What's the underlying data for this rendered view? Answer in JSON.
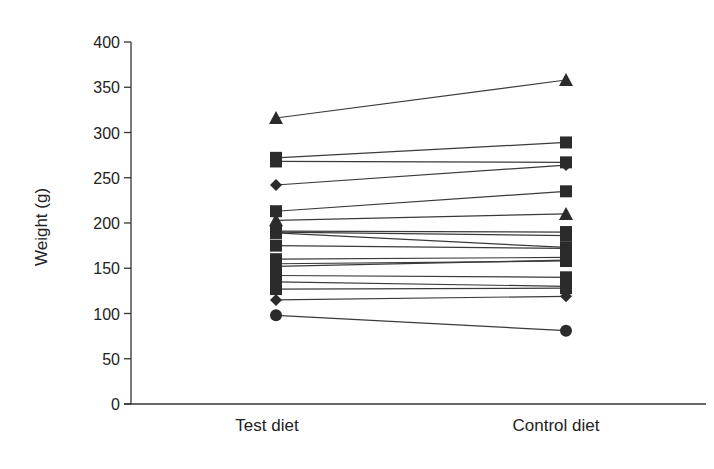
{
  "chart_data": {
    "type": "line",
    "subtype": "paired-dot (before/after) plot",
    "title": "",
    "xlabel": "",
    "ylabel": "Weight (g)",
    "categories": [
      "Test diet",
      "Control diet"
    ],
    "ylim": [
      0,
      400
    ],
    "yticks": [
      0,
      50,
      100,
      150,
      200,
      250,
      300,
      350,
      400
    ],
    "grid": false,
    "legend": null,
    "series": [
      {
        "name": "subject 1",
        "marker": "triangle",
        "values": [
          316,
          358
        ]
      },
      {
        "name": "subject 2",
        "marker": "square",
        "values": [
          272,
          289
        ]
      },
      {
        "name": "subject 3",
        "marker": "square",
        "values": [
          268,
          267
        ]
      },
      {
        "name": "subject 4",
        "marker": "diamond",
        "values": [
          242,
          264
        ]
      },
      {
        "name": "subject 5",
        "marker": "square",
        "values": [
          213,
          235
        ]
      },
      {
        "name": "subject 6",
        "marker": "triangle",
        "values": [
          203,
          210
        ]
      },
      {
        "name": "subject 7",
        "marker": "square",
        "values": [
          191,
          190
        ]
      },
      {
        "name": "subject 8",
        "marker": "square",
        "values": [
          190,
          186
        ]
      },
      {
        "name": "subject 9",
        "marker": "square",
        "values": [
          189,
          173
        ]
      },
      {
        "name": "subject 10",
        "marker": "square",
        "values": [
          175,
          172
        ]
      },
      {
        "name": "subject 11",
        "marker": "square",
        "values": [
          160,
          162
        ]
      },
      {
        "name": "subject 12",
        "marker": "square",
        "values": [
          155,
          158
        ]
      },
      {
        "name": "subject 13",
        "marker": "square",
        "values": [
          152,
          159
        ]
      },
      {
        "name": "subject 14",
        "marker": "square",
        "values": [
          142,
          140
        ]
      },
      {
        "name": "subject 15",
        "marker": "square",
        "values": [
          135,
          130
        ]
      },
      {
        "name": "subject 16",
        "marker": "square",
        "values": [
          127,
          128
        ]
      },
      {
        "name": "subject 17",
        "marker": "diamond",
        "values": [
          115,
          119
        ]
      },
      {
        "name": "subject 18",
        "marker": "circle",
        "values": [
          98,
          81
        ]
      }
    ]
  },
  "axes": {
    "y_title": "Weight (g)",
    "y_tick_labels": [
      "0",
      "50",
      "100",
      "150",
      "200",
      "250",
      "300",
      "350",
      "400"
    ],
    "x_labels": [
      "Test diet",
      "Control diet"
    ]
  },
  "colors": {
    "ink": "#2b2b2b",
    "background": "#ffffff"
  }
}
